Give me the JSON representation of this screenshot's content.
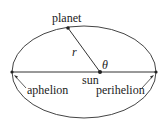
{
  "diagram": {
    "labels": {
      "planet": "planet",
      "r": "r",
      "theta": "θ",
      "sun": "sun",
      "aphelion": "aphelion",
      "perihelion": "perihelion"
    },
    "colors": {
      "stroke": "#333333",
      "text": "#222222",
      "background": "#ffffff"
    }
  }
}
